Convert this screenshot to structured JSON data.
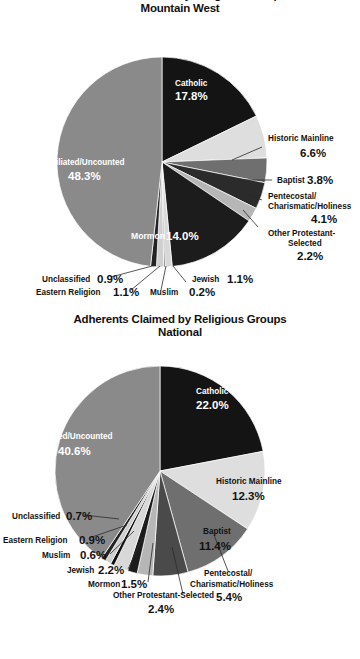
{
  "page": {
    "background": "#ffffff",
    "width": 360,
    "height": 659
  },
  "charts": [
    {
      "id": "mountain-west",
      "title_line1": "Adherents Claimed by Religious Groups",
      "title_line2": "Mountain West",
      "labels": {
        "catholic_name": "Catholic",
        "catholic_pct": "17.8%",
        "historic_name": "Historic Mainline",
        "historic_pct": "6.6%",
        "baptist_name": "Baptist",
        "baptist_pct": "3.8%",
        "pente_name1": "Pentecostal/",
        "pente_name2": "Charismatic/Holiness",
        "pente_pct": "4.1%",
        "otherprot_name1": "Other Protestant-",
        "otherprot_name2": "Selected",
        "otherprot_pct": "2.2%",
        "mormon_name": "Mormon",
        "mormon_pct": "14.0%",
        "jewish_name": "Jewish",
        "jewish_pct": "1.1%",
        "muslim_name": "Muslim",
        "muslim_pct": "0.2%",
        "eastern_name": "Eastern Religion",
        "eastern_pct": "1.1%",
        "unclassified_name": "Unclassified",
        "unclassified_pct": "0.9%",
        "unaffiliated_name": "Unaffiliated/Uncounted",
        "unaffiliated_pct": "48.3%"
      }
    },
    {
      "id": "national",
      "title_line1": "Adherents Claimed by Religious Groups",
      "title_line2": "National",
      "labels": {
        "catholic_name": "Catholic",
        "catholic_pct": "22.0%",
        "historic_name": "Historic Mainline",
        "historic_pct": "12.3%",
        "baptist_name": "Baptist",
        "baptist_pct": "11.4%",
        "pente_name1": "Pentecostal/",
        "pente_name2": "Charismatic/Holiness",
        "pente_pct": "5.4%",
        "otherprot_name": "Other Protestant-Selected",
        "otherprot_pct": "2.4%",
        "mormon_name": "Mormon",
        "mormon_pct": "1.5%",
        "jewish_name": "Jewish",
        "jewish_pct": "2.2%",
        "muslim_name": "Muslim",
        "muslim_pct": "0.6%",
        "eastern_name": "Eastern Religion",
        "eastern_pct": "0.9%",
        "unclassified_name": "Unclassified",
        "unclassified_pct": "0.7%",
        "unaffiliated_name": "Unaffiliated/Uncounted",
        "unaffiliated_pct": "40.6%"
      }
    }
  ],
  "chart_data": [
    {
      "type": "pie",
      "title": "Adherents Claimed by Religious Groups — Mountain West",
      "subtitle": "Mountain West",
      "unit": "percent",
      "start_angle_deg": 0,
      "direction": "clockwise",
      "legend": "none (direct labels)",
      "categories": [
        "Catholic",
        "Historic Mainline",
        "Baptist",
        "Pentecostal/Charismatic/Holiness",
        "Other Protestant-Selected",
        "Mormon",
        "Jewish",
        "Muslim",
        "Eastern Religion",
        "Unclassified",
        "Unaffiliated/Uncounted"
      ],
      "values": [
        17.8,
        6.6,
        3.8,
        4.1,
        2.2,
        14.0,
        1.1,
        0.2,
        1.1,
        0.9,
        48.3
      ],
      "colors": [
        "#141414",
        "#dedede",
        "#6f6f6f",
        "#2b2b2b",
        "#b6b6b6",
        "#1c1c1c",
        "#d8d8d8",
        "#111111",
        "#cfcfcf",
        "#232323",
        "#8a8a8a"
      ],
      "label_colors": [
        "#ffffff",
        "#121212",
        "#121212",
        "#121212",
        "#121212",
        "#ffffff",
        "#121212",
        "#121212",
        "#121212",
        "#121212",
        "#ffffff"
      ]
    },
    {
      "type": "pie",
      "title": "Adherents Claimed by Religious Groups — National",
      "subtitle": "National",
      "unit": "percent",
      "start_angle_deg": 0,
      "direction": "clockwise",
      "legend": "none (direct labels)",
      "categories": [
        "Catholic",
        "Historic Mainline",
        "Baptist",
        "Pentecostal/Charismatic/Holiness",
        "Other Protestant-Selected",
        "Mormon",
        "Jewish",
        "Muslim",
        "Eastern Religion",
        "Unclassified",
        "Unaffiliated/Uncounted"
      ],
      "values": [
        22.0,
        12.3,
        11.4,
        5.4,
        2.4,
        1.5,
        2.2,
        0.6,
        0.9,
        0.7,
        40.6
      ],
      "colors": [
        "#141414",
        "#dedede",
        "#6f6f6f",
        "#4a4a4a",
        "#b6b6b6",
        "#1c1c1c",
        "#d8d8d8",
        "#111111",
        "#cfcfcf",
        "#232323",
        "#8a8a8a"
      ],
      "label_colors": [
        "#ffffff",
        "#121212",
        "#121212",
        "#121212",
        "#121212",
        "#121212",
        "#121212",
        "#121212",
        "#121212",
        "#121212",
        "#ffffff"
      ]
    }
  ]
}
